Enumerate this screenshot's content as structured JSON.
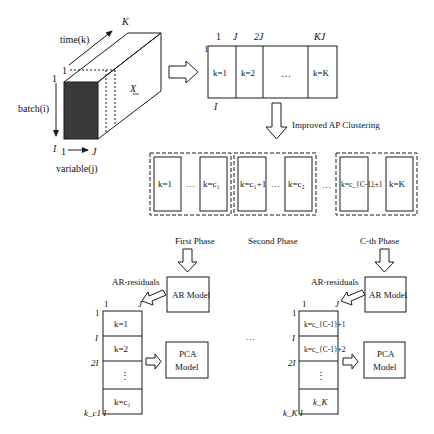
{
  "diagram": {
    "cube": {
      "axis_time": "time(k)",
      "axis_time_start": "1",
      "axis_time_end": "K",
      "axis_batch": "batch(i)",
      "axis_batch_start": "1",
      "axis_batch_end": "I",
      "axis_variable": "variable(j)",
      "axis_variable_start": "1",
      "axis_variable_end": "J",
      "tensor_label": "X"
    },
    "unfolded_matrix": {
      "top_ticks": [
        "1",
        "J",
        "2J",
        "KJ"
      ],
      "left_top": "1",
      "left_bottom": "I",
      "blocks": [
        "k=1",
        "k=2",
        "…",
        "k=K"
      ]
    },
    "clustering": {
      "label": "Improved AP Clustering",
      "groups": [
        {
          "blocks": [
            "k=1",
            "k=c₁"
          ],
          "sep": "…"
        },
        {
          "blocks": [
            "k=c₁+1",
            "k=c₂"
          ],
          "sep": "…"
        },
        {
          "blocks": [
            "k=c_{C-1}+1",
            "k=K"
          ],
          "sep": "…"
        }
      ],
      "between_groups": "…"
    },
    "phases": {
      "first": "First Phase",
      "second": "Second Phase",
      "cth": "C-th Phase",
      "between": "…"
    },
    "phase_first": {
      "ar_residuals": "AR-residuals",
      "top_ticks": [
        "1",
        "J"
      ],
      "left_ticks": [
        "1",
        "I",
        "2I",
        "k_c1 I"
      ],
      "blocks": [
        "k=1",
        "k=2",
        "⋮",
        "k=c₁"
      ],
      "ar_model": "AR Model",
      "pca_model_line1": "PCA",
      "pca_model_line2": "Model"
    },
    "phase_cth": {
      "ar_residuals": "AR-residuals",
      "top_ticks": [
        "1",
        "J"
      ],
      "left_ticks": [
        "1",
        "I",
        "2I",
        "k_K I"
      ],
      "blocks": [
        "k=c_{C-1}+1",
        "k=c_{C-1}+2",
        "⋮",
        "k_K"
      ],
      "ar_model": "AR Model",
      "pca_model_line1": "PCA",
      "pca_model_line2": "Model"
    },
    "colors": {
      "stroke": "#1a1a1a",
      "front_face": "#3a3a3a",
      "background": "#ffffff"
    }
  }
}
